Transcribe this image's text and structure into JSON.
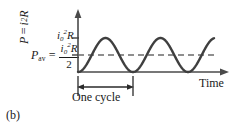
{
  "figure": {
    "caption": "(b)",
    "axis": {
      "y_label_parts": {
        "p": "P",
        "equals": "=",
        "i": "i",
        "exp": "2",
        "r": "R"
      },
      "x_label": "Time"
    },
    "annotations": {
      "pav": {
        "p": "P",
        "sub": "av",
        "equals": "="
      },
      "average_fraction": {
        "numerator": {
          "i": "i",
          "sub": "0",
          "sup": "2",
          "r": "R"
        },
        "denominator": "2"
      },
      "peak_label": {
        "i": "i",
        "sub": "0",
        "sup": "2",
        "r": "R"
      },
      "cycle_span_label": "One cycle"
    },
    "colors": {
      "curve": "#3f3f3f",
      "axis": "#4a4a4a",
      "dashed_average": "#6b6b6b",
      "text": "#1a1a1a",
      "background": "#ffffff"
    }
  },
  "chart_data": {
    "type": "line",
    "title": "",
    "xlabel": "Time",
    "ylabel": "P = i²R",
    "waveform": "sin_squared",
    "ylim": [
      0,
      1.0
    ],
    "peak_value": 1.0,
    "peak_value_label": "i0²R",
    "average_value": 0.5,
    "average_value_label": "i0²R / 2",
    "cycles_shown": 4.5,
    "cycle_span_start": 0.0,
    "cycle_span_end": 1.0,
    "yticks": [
      0.5,
      1.0
    ],
    "ytick_labels": [
      "i0²R/2",
      "i0²R"
    ],
    "grid": false,
    "legend": false,
    "series": [
      {
        "name": "Instantaneous power",
        "x": [
          0.0,
          0.05,
          0.1,
          0.15,
          0.2,
          0.25,
          0.3,
          0.35,
          0.4,
          0.45,
          0.5,
          0.55,
          0.6,
          0.65,
          0.7,
          0.75,
          0.8,
          0.85,
          0.9,
          0.95,
          1.0,
          1.05,
          1.1,
          1.15,
          1.2,
          1.25,
          1.3,
          1.35,
          1.4,
          1.45,
          1.5,
          1.55,
          1.6,
          1.65,
          1.7,
          1.75,
          1.8,
          1.85,
          1.9,
          1.95,
          2.0,
          2.05,
          2.1,
          2.15,
          2.2,
          2.25
        ],
        "values": [
          0.0,
          0.095,
          0.345,
          0.655,
          0.905,
          1.0,
          0.905,
          0.655,
          0.345,
          0.095,
          0.0,
          0.095,
          0.345,
          0.655,
          0.905,
          1.0,
          0.905,
          0.655,
          0.345,
          0.095,
          0.0,
          0.095,
          0.345,
          0.655,
          0.905,
          1.0,
          0.905,
          0.655,
          0.345,
          0.095,
          0.0,
          0.095,
          0.345,
          0.655,
          0.905,
          1.0,
          0.905,
          0.655,
          0.345,
          0.095,
          0.0,
          0.095,
          0.345,
          0.655,
          0.905,
          1.0
        ]
      },
      {
        "name": "Average power",
        "style": "dashed",
        "constant": 0.5
      }
    ]
  }
}
